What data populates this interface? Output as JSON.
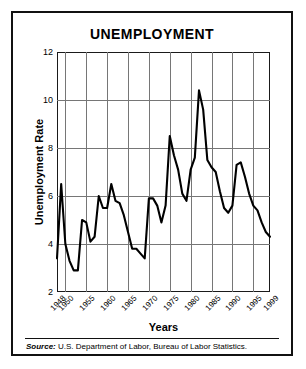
{
  "figure": {
    "title": "UNEMPLOYMENT",
    "source_prefix": "Source:",
    "source_text": " U.S. Department of Labor, Bureau of Labor Statistics."
  },
  "chart_data": {
    "type": "line",
    "title": "UNEMPLOYMENT",
    "xlabel": "Years",
    "ylabel": "Unemployment Rate",
    "xlim": [
      1948,
      1999
    ],
    "ylim": [
      2,
      12
    ],
    "yticks": [
      2,
      4,
      6,
      8,
      10,
      12
    ],
    "xticks": [
      1948,
      1950,
      1955,
      1960,
      1965,
      1970,
      1975,
      1980,
      1985,
      1990,
      1995,
      1999
    ],
    "grid": true,
    "legend": "none",
    "line_color": "#000000",
    "grid_color": "#767676",
    "series": [
      {
        "name": "Unemployment Rate",
        "x": [
          1948,
          1949,
          1950,
          1951,
          1952,
          1953,
          1954,
          1955,
          1956,
          1957,
          1958,
          1959,
          1960,
          1961,
          1962,
          1963,
          1964,
          1965,
          1966,
          1967,
          1968,
          1969,
          1970,
          1971,
          1972,
          1973,
          1974,
          1975,
          1976,
          1977,
          1978,
          1979,
          1980,
          1981,
          1982,
          1983,
          1984,
          1985,
          1986,
          1987,
          1988,
          1989,
          1990,
          1991,
          1992,
          1993,
          1994,
          1995,
          1996,
          1997,
          1998,
          1999
        ],
        "values": [
          3.4,
          6.5,
          4.0,
          3.3,
          2.9,
          2.9,
          5.0,
          4.9,
          4.1,
          4.3,
          6.0,
          5.5,
          5.5,
          6.5,
          5.8,
          5.7,
          5.2,
          4.5,
          3.8,
          3.8,
          3.6,
          3.4,
          5.9,
          5.9,
          5.6,
          4.9,
          5.6,
          8.5,
          7.7,
          7.1,
          6.1,
          5.8,
          7.1,
          7.6,
          10.4,
          9.6,
          7.5,
          7.2,
          7.0,
          6.2,
          5.5,
          5.3,
          5.6,
          7.3,
          7.4,
          6.8,
          6.1,
          5.6,
          5.4,
          4.9,
          4.5,
          4.3
        ]
      }
    ]
  },
  "axes": {
    "yticks": [
      "12",
      "10",
      "8",
      "6",
      "4",
      "2"
    ],
    "xticks": [
      "1948",
      "1950",
      "1955",
      "1960",
      "1965",
      "1970",
      "1975",
      "1980",
      "1985",
      "1990",
      "1995",
      "1999"
    ]
  }
}
